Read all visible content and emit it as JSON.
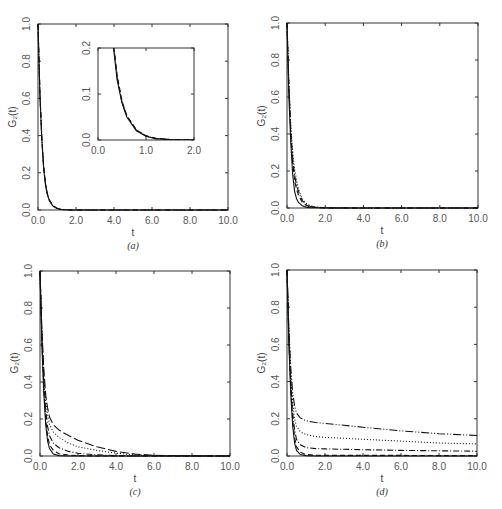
{
  "figure": {
    "panels": [
      {
        "id": "a",
        "caption": "(a)",
        "xlabel": "t",
        "ylabel": "G₂(t)"
      },
      {
        "id": "b",
        "caption": "(b)",
        "xlabel": "t",
        "ylabel": "G₂(t)"
      },
      {
        "id": "c",
        "caption": "(c)",
        "xlabel": "t",
        "ylabel": "G₂(t)"
      },
      {
        "id": "d",
        "caption": "(d)",
        "xlabel": "t",
        "ylabel": "G₂(t)"
      }
    ],
    "x_ticks": [
      "0.0",
      "2.0",
      "4.0",
      "6.0",
      "8.0",
      "10.0"
    ],
    "y_ticks": [
      "0.0",
      "0.2",
      "0.4",
      "0.6",
      "0.8",
      "1.0"
    ],
    "inset": {
      "x_ticks": [
        "0.0",
        "1.0",
        "2.0"
      ],
      "y_ticks": [
        "0.0",
        "0.1",
        "0.2"
      ]
    }
  },
  "chart_data": [
    {
      "panel": "a",
      "type": "line",
      "title": "",
      "caption": "(a)",
      "xlabel": "t",
      "ylabel": "G2(t)",
      "xlim": [
        0,
        10
      ],
      "ylim": [
        0,
        1
      ],
      "grid": false,
      "legend": null,
      "x": [
        0,
        0.1,
        0.2,
        0.3,
        0.4,
        0.5,
        0.6,
        0.8,
        1.0,
        1.2,
        1.5,
        2.0,
        4.0,
        10.0
      ],
      "series": [
        {
          "name": "solid",
          "style": "solid",
          "values": [
            1.0,
            0.62,
            0.38,
            0.22,
            0.13,
            0.08,
            0.05,
            0.02,
            0.008,
            0.003,
            0.001,
            0.0,
            0.0,
            0.0
          ]
        },
        {
          "name": "dashed",
          "style": "dashed",
          "values": [
            1.0,
            0.63,
            0.39,
            0.23,
            0.14,
            0.085,
            0.053,
            0.022,
            0.009,
            0.004,
            0.001,
            0.0,
            0.0,
            0.0
          ]
        },
        {
          "name": "dash-dot",
          "style": "dashdot",
          "values": [
            1.0,
            0.63,
            0.39,
            0.23,
            0.135,
            0.082,
            0.052,
            0.021,
            0.009,
            0.003,
            0.001,
            0.0,
            0.0,
            0.0
          ]
        }
      ],
      "inset": {
        "xlim": [
          0,
          2
        ],
        "ylim": [
          0,
          0.2
        ],
        "note": "zoom of main curves, all overlapping"
      }
    },
    {
      "panel": "b",
      "type": "line",
      "title": "",
      "caption": "(b)",
      "xlabel": "t",
      "ylabel": "G2(t)",
      "xlim": [
        0,
        10
      ],
      "ylim": [
        0,
        1
      ],
      "grid": false,
      "legend": null,
      "x": [
        0,
        0.1,
        0.2,
        0.3,
        0.4,
        0.5,
        0.6,
        0.8,
        1.0,
        1.2,
        1.5,
        2.0,
        4.0,
        10.0
      ],
      "series": [
        {
          "name": "solid",
          "style": "solid",
          "values": [
            1.0,
            0.6,
            0.35,
            0.18,
            0.09,
            0.05,
            0.03,
            0.012,
            0.005,
            0.002,
            0.001,
            0.0,
            0.0,
            0.0
          ]
        },
        {
          "name": "dashed",
          "style": "dashed",
          "values": [
            1.0,
            0.65,
            0.4,
            0.24,
            0.15,
            0.1,
            0.07,
            0.03,
            0.015,
            0.007,
            0.003,
            0.0,
            0.0,
            0.0
          ]
        },
        {
          "name": "dash-dot",
          "style": "dashdot",
          "values": [
            1.0,
            0.66,
            0.42,
            0.27,
            0.18,
            0.12,
            0.09,
            0.04,
            0.02,
            0.01,
            0.004,
            0.001,
            0.0,
            0.0
          ]
        },
        {
          "name": "dotted",
          "style": "dotted",
          "values": [
            1.0,
            0.67,
            0.44,
            0.3,
            0.21,
            0.15,
            0.1,
            0.05,
            0.025,
            0.013,
            0.006,
            0.002,
            0.0,
            0.0
          ]
        }
      ]
    },
    {
      "panel": "c",
      "type": "line",
      "title": "",
      "caption": "(c)",
      "xlabel": "t",
      "ylabel": "G2(t)",
      "xlim": [
        0,
        10
      ],
      "ylim": [
        0,
        1
      ],
      "grid": false,
      "legend": null,
      "x": [
        0,
        0.1,
        0.2,
        0.3,
        0.4,
        0.5,
        0.7,
        1.0,
        1.5,
        2.0,
        3.0,
        4.0,
        5.0,
        6.0,
        8.0,
        10.0
      ],
      "series": [
        {
          "name": "solid",
          "style": "solid",
          "values": [
            1.0,
            0.6,
            0.34,
            0.17,
            0.08,
            0.04,
            0.01,
            0.002,
            0.0,
            0.0,
            0.0,
            0.0,
            0.0,
            0.0,
            0.0,
            0.0
          ]
        },
        {
          "name": "dashed",
          "style": "dashed",
          "values": [
            1.0,
            0.62,
            0.37,
            0.2,
            0.11,
            0.06,
            0.03,
            0.012,
            0.005,
            0.002,
            0.0,
            0.0,
            0.0,
            0.0,
            0.0,
            0.0
          ]
        },
        {
          "name": "dash-dot",
          "style": "dashdot",
          "values": [
            1.0,
            0.64,
            0.4,
            0.25,
            0.16,
            0.11,
            0.07,
            0.045,
            0.025,
            0.015,
            0.006,
            0.002,
            0.0,
            0.0,
            0.0,
            0.0
          ]
        },
        {
          "name": "dotted",
          "style": "dotted",
          "values": [
            1.0,
            0.66,
            0.44,
            0.3,
            0.22,
            0.17,
            0.13,
            0.1,
            0.07,
            0.05,
            0.03,
            0.015,
            0.006,
            0.002,
            0.0,
            0.0
          ]
        },
        {
          "name": "long-dash",
          "style": "longdash",
          "values": [
            1.0,
            0.68,
            0.47,
            0.33,
            0.26,
            0.21,
            0.17,
            0.14,
            0.11,
            0.085,
            0.05,
            0.025,
            0.01,
            0.004,
            0.001,
            0.0
          ]
        }
      ]
    },
    {
      "panel": "d",
      "type": "line",
      "title": "",
      "caption": "(d)",
      "xlabel": "t",
      "ylabel": "G2(t)",
      "xlim": [
        0,
        10
      ],
      "ylim": [
        0,
        1
      ],
      "grid": false,
      "legend": null,
      "x": [
        0,
        0.1,
        0.2,
        0.3,
        0.4,
        0.5,
        0.7,
        1.0,
        1.5,
        2.0,
        3.0,
        4.0,
        5.0,
        6.0,
        8.0,
        10.0
      ],
      "series": [
        {
          "name": "solid",
          "style": "solid",
          "values": [
            1.0,
            0.6,
            0.33,
            0.16,
            0.07,
            0.03,
            0.008,
            0.002,
            0.0,
            0.0,
            0.0,
            0.0,
            0.0,
            0.0,
            0.0,
            0.0
          ]
        },
        {
          "name": "dashed",
          "style": "dashed",
          "values": [
            1.0,
            0.62,
            0.36,
            0.19,
            0.1,
            0.05,
            0.02,
            0.008,
            0.004,
            0.003,
            0.003,
            0.003,
            0.003,
            0.003,
            0.002,
            0.002
          ]
        },
        {
          "name": "dash-dot",
          "style": "dashdot",
          "values": [
            1.0,
            0.64,
            0.39,
            0.23,
            0.14,
            0.09,
            0.06,
            0.045,
            0.04,
            0.038,
            0.036,
            0.034,
            0.032,
            0.03,
            0.028,
            0.026
          ]
        },
        {
          "name": "dotted",
          "style": "dotted",
          "values": [
            1.0,
            0.66,
            0.43,
            0.29,
            0.2,
            0.16,
            0.13,
            0.115,
            0.105,
            0.1,
            0.095,
            0.09,
            0.085,
            0.08,
            0.07,
            0.065
          ]
        },
        {
          "name": "dash-dot-dot",
          "style": "dashdotdot",
          "values": [
            1.0,
            0.68,
            0.47,
            0.34,
            0.27,
            0.23,
            0.205,
            0.19,
            0.18,
            0.175,
            0.165,
            0.155,
            0.145,
            0.135,
            0.12,
            0.11
          ]
        }
      ]
    }
  ]
}
